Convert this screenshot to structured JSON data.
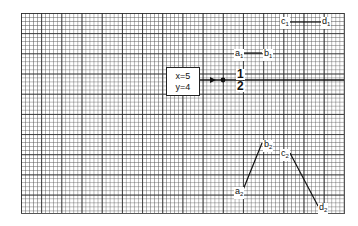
{
  "diagram": {
    "type": "graph-paper-illustration",
    "box": {
      "line1": "x=5",
      "line2": "y=4"
    },
    "fraction": {
      "numerator": "1",
      "denominator": "2"
    },
    "segments": [
      {
        "name": "a1-b1",
        "start_label": "a",
        "start_sub": "1",
        "end_label": "b",
        "end_sub": "1"
      },
      {
        "name": "c1-d1",
        "start_label": "c",
        "start_sub": "1",
        "end_label": "d",
        "end_sub": "1"
      },
      {
        "name": "a2-b2",
        "start_label": "a",
        "start_sub": "2",
        "end_label": "b",
        "end_sub": "2"
      },
      {
        "name": "c2-d2",
        "start_label": "c",
        "start_sub": "2",
        "end_label": "d",
        "end_sub": "2"
      }
    ],
    "colors": {
      "ink": "#111111",
      "grid_major": "#282828",
      "grid_minor": "#5a5a5a",
      "paper": "#ffffff"
    }
  }
}
